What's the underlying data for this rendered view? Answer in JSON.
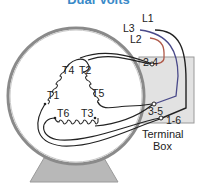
{
  "title": "Dual Volts",
  "line_labels": {
    "l1": "L1",
    "l2": "L2",
    "l3": "L3"
  },
  "terminal_labels": {
    "t1": "T1",
    "t2": "T2",
    "t3": "T3",
    "t4": "T4",
    "t5": "T5",
    "t6": "T6"
  },
  "connection_labels": {
    "c24": "2-4",
    "c35": "3-5",
    "c16": "1-6"
  },
  "terminal_box": {
    "line1": "Terminal",
    "line2": "Box"
  },
  "colors": {
    "title": "#3a8ac8",
    "l1_wire": "#222222",
    "l2_wire": "#b05a4a",
    "l3_wire": "#4a4a8a",
    "terminal_box_fill": "#e2e2e2",
    "motor_ring": "#8a8a8a",
    "base_fill": "#b8b8b8"
  }
}
